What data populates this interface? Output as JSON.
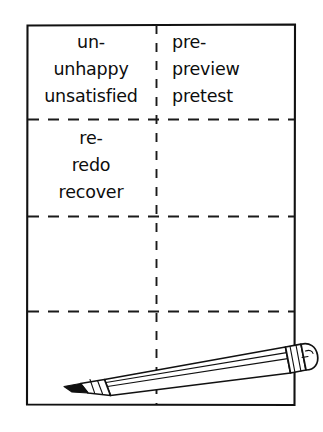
{
  "illustration": {
    "title": "Prefix word-study folded paper with pencil",
    "ink_color": "#111111",
    "paper_color": "#ffffff"
  },
  "paper": {
    "name": "folded-paper-sheet",
    "left": 26,
    "top": 24,
    "right": 296,
    "bottom": 406,
    "fold_lines": {
      "vertical_x": 156,
      "horizontal_y": [
        119,
        216,
        311
      ]
    }
  },
  "cells": [
    {
      "id": "prefix-un",
      "column": "left",
      "row": 1,
      "align": "center",
      "lines": [
        "un-",
        "unhappy",
        "unsatisfied"
      ]
    },
    {
      "id": "prefix-pre",
      "column": "right",
      "row": 1,
      "align": "left",
      "lines": [
        "pre-",
        "preview",
        "pretest"
      ]
    },
    {
      "id": "prefix-re",
      "column": "left",
      "row": 2,
      "align": "center",
      "lines": [
        "re-",
        "redo",
        "recover"
      ]
    },
    {
      "id": "empty-right-row2",
      "column": "right",
      "row": 2,
      "align": "left",
      "lines": []
    },
    {
      "id": "empty-left-row3",
      "column": "left",
      "row": 3,
      "align": "center",
      "lines": []
    },
    {
      "id": "empty-right-row3",
      "column": "right",
      "row": 3,
      "align": "left",
      "lines": []
    },
    {
      "id": "empty-left-row4",
      "column": "left",
      "row": 4,
      "align": "center",
      "lines": []
    },
    {
      "id": "empty-right-row4",
      "column": "right",
      "row": 4,
      "align": "left",
      "lines": []
    }
  ],
  "pencil": {
    "name": "pencil",
    "tip_point": [
      64,
      386
    ],
    "eraser_end": [
      314,
      334
    ],
    "orientation": "diagonal lower-left to upper-right",
    "parts": [
      "graphite-point",
      "sharpened-wood-cone",
      "hexagonal-barrel",
      "metal-ferrule",
      "eraser"
    ]
  }
}
